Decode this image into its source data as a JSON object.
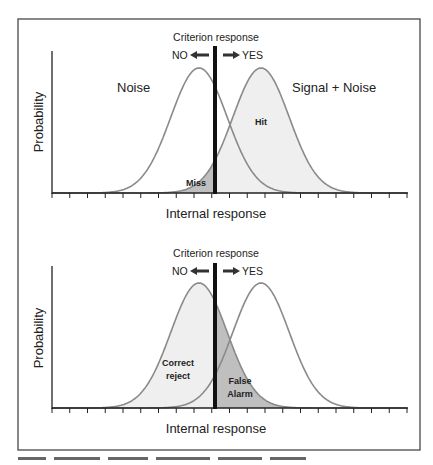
{
  "figure": {
    "panels": [
      {
        "id": "top",
        "criterion_label": "Criterion response",
        "no_label": "NO",
        "yes_label": "YES",
        "ylabel": "Probability",
        "xlabel": "Internal response",
        "curve_labels": {
          "noise": "Noise",
          "signal": "Signal + Noise"
        },
        "region_labels": {
          "left": "Miss",
          "right": "Hit"
        }
      },
      {
        "id": "bottom",
        "criterion_label": "Criterion response",
        "no_label": "NO",
        "yes_label": "YES",
        "ylabel": "Probability",
        "xlabel": "Internal response",
        "region_labels": {
          "left_line1": "Correct",
          "left_line2": "reject",
          "right_line1": "False",
          "right_line2": "Alarm"
        }
      }
    ],
    "colors": {
      "frame": "#555555",
      "axis": "#222222",
      "curve": "#8a8a8a",
      "criterion": "#111111",
      "light_fill": "#eeeeee",
      "dark_fill": "#bdbdbd",
      "text": "#222222"
    }
  },
  "chart_data": [
    {
      "type": "line",
      "title": "Signal detection: Hit and Miss",
      "xlabel": "Internal response",
      "ylabel": "Probability",
      "series": [
        {
          "name": "Noise",
          "distribution": "normal",
          "mean": 0,
          "sd": 1
        },
        {
          "name": "Signal + Noise",
          "distribution": "normal",
          "mean": 2.2,
          "sd": 1
        }
      ],
      "criterion": 0.6,
      "shaded_regions": [
        {
          "label": "Miss",
          "series": "Signal + Noise",
          "side": "below criterion",
          "shade": "dark"
        },
        {
          "label": "Hit",
          "series": "Signal + Noise",
          "side": "above criterion",
          "shade": "light"
        }
      ],
      "annotations": [
        "Criterion response",
        "NO ←",
        "→ YES"
      ],
      "x_ticks": 20,
      "grid": false
    },
    {
      "type": "line",
      "title": "Signal detection: Correct reject and False Alarm",
      "xlabel": "Internal response",
      "ylabel": "Probability",
      "series": [
        {
          "name": "Noise",
          "distribution": "normal",
          "mean": 0,
          "sd": 1
        },
        {
          "name": "Signal + Noise",
          "distribution": "normal",
          "mean": 2.2,
          "sd": 1
        }
      ],
      "criterion": 0.6,
      "shaded_regions": [
        {
          "label": "Correct reject",
          "series": "Noise",
          "side": "below criterion",
          "shade": "light"
        },
        {
          "label": "False Alarm",
          "series": "Noise",
          "side": "above criterion",
          "shade": "dark"
        }
      ],
      "annotations": [
        "Criterion response",
        "NO ←",
        "→ YES"
      ],
      "x_ticks": 20,
      "grid": false
    }
  ]
}
